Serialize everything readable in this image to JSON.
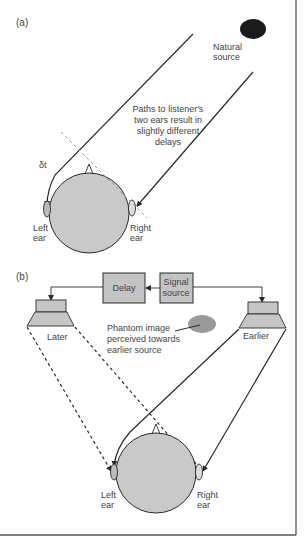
{
  "colors": {
    "ink": "#2a2a2a",
    "head_fill": "#c9c9c9",
    "box_fill": "#c4c4c4",
    "speaker_fill": "#c6c6c6",
    "phantom_fill": "#9a9a9a",
    "source_fill": "#1a1a1a",
    "text": "#444444",
    "frame": "#555555"
  },
  "panel_a": {
    "label": "(a)",
    "source": {
      "icon": "natural-source-icon",
      "label_line1": "Natural",
      "label_line2": "source"
    },
    "caption": {
      "line1": "Paths to listener's",
      "line2": "two ears result in",
      "line3": "slightly different",
      "line4": "delays"
    },
    "delta_t": "δt",
    "left_ear": {
      "line1": "Left",
      "line2": "ear"
    },
    "right_ear": {
      "line1": "Right",
      "line2": "ear"
    }
  },
  "panel_b": {
    "label": "(b)",
    "delay_box": "Delay",
    "signal_box": {
      "line1": "Signal",
      "line2": "source"
    },
    "left_speaker_label": "Later",
    "right_speaker_label": "Earlier",
    "phantom": {
      "line1": "Phantom image",
      "line2": "perceived towards",
      "line3": "earlier source"
    },
    "left_ear": {
      "line1": "Left",
      "line2": "ear"
    },
    "right_ear": {
      "line1": "Right",
      "line2": "ear"
    }
  }
}
